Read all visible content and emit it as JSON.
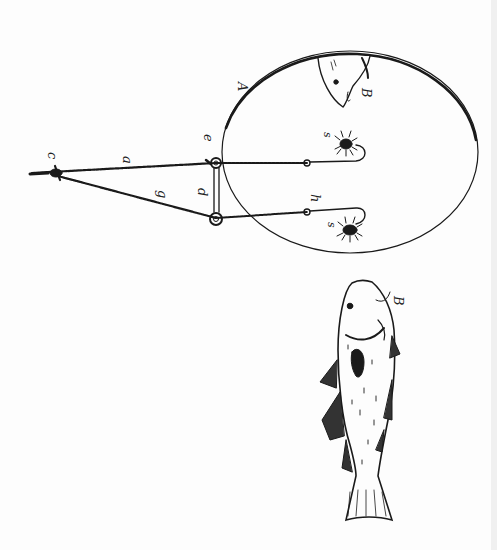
{
  "figure": {
    "type": "patent-drawing",
    "ink_color": "#1a1a1a",
    "paper_color": "#fdfdfd"
  },
  "labels": {
    "A": "A",
    "B_top": "B",
    "B_fish": "B",
    "a": "a",
    "c": "c",
    "d": "d",
    "e": "e",
    "g": "g",
    "h": "h",
    "s_upper": "s",
    "s_lower": "s"
  },
  "parts": [
    {
      "id": "A",
      "description": "elliptical hoop"
    },
    {
      "id": "B",
      "description": "fish"
    },
    {
      "id": "a",
      "description": "upper line"
    },
    {
      "id": "c",
      "description": "knot / joining point"
    },
    {
      "id": "d",
      "description": "spreader bar"
    },
    {
      "id": "e",
      "description": "ring / eye"
    },
    {
      "id": "g",
      "description": "lower line"
    },
    {
      "id": "h",
      "description": "hook shank"
    },
    {
      "id": "s",
      "description": "bait on hooks"
    }
  ]
}
